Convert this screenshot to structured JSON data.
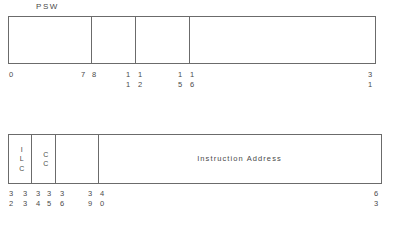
{
  "diagram": {
    "title": "PSW",
    "registers": [
      {
        "id": "psw",
        "caption": "PSW",
        "bit_range": [
          0,
          31
        ],
        "fields": [
          {
            "label": "",
            "start_bit": 0,
            "end_bit": 7
          },
          {
            "label": "",
            "start_bit": 8,
            "end_bit": 11
          },
          {
            "label": "",
            "start_bit": 12,
            "end_bit": 15
          },
          {
            "label": "",
            "start_bit": 16,
            "end_bit": 31
          }
        ],
        "bit_markers": [
          {
            "value": "0",
            "tens": "0",
            "ones": ""
          },
          {
            "value": "7",
            "tens": "7",
            "ones": ""
          },
          {
            "value": "8",
            "tens": "8",
            "ones": ""
          },
          {
            "value": "11",
            "tens": "1",
            "ones": "1"
          },
          {
            "value": "12",
            "tens": "1",
            "ones": "2"
          },
          {
            "value": "15",
            "tens": "1",
            "ones": "5"
          },
          {
            "value": "16",
            "tens": "1",
            "ones": "6"
          },
          {
            "value": "31",
            "tens": "3",
            "ones": "1"
          }
        ]
      },
      {
        "id": "psw2",
        "caption": "",
        "bit_range": [
          32,
          63
        ],
        "fields": [
          {
            "label": "ILC",
            "label_chars": [
              "I",
              "L",
              "C"
            ],
            "start_bit": 32,
            "end_bit": 33
          },
          {
            "label": "CC",
            "label_chars": [
              "C",
              "C"
            ],
            "start_bit": 34,
            "end_bit": 35
          },
          {
            "label": "",
            "label_chars": [],
            "start_bit": 36,
            "end_bit": 39
          },
          {
            "label": "Instruction Address",
            "label_chars": [],
            "start_bit": 40,
            "end_bit": 63
          }
        ],
        "bit_markers": [
          {
            "value": "32",
            "tens": "3",
            "ones": "2"
          },
          {
            "value": "33",
            "tens": "3",
            "ones": "3"
          },
          {
            "value": "34",
            "tens": "3",
            "ones": "4"
          },
          {
            "value": "35",
            "tens": "3",
            "ones": "5"
          },
          {
            "value": "36",
            "tens": "3",
            "ones": "6"
          },
          {
            "value": "39",
            "tens": "3",
            "ones": "9"
          },
          {
            "value": "40",
            "tens": "4",
            "ones": "0"
          },
          {
            "value": "63",
            "tens": "6",
            "ones": "3"
          }
        ]
      }
    ],
    "labels": {
      "ilc_line1": "I",
      "ilc_line2": "L",
      "ilc_line3": "C",
      "cc_line1": "C",
      "cc_line2": "C",
      "instruction_address": "Instruction Address"
    },
    "colors": {
      "line": "#6b6b6b",
      "text": "#4a4a4a",
      "background": "#ffffff"
    }
  }
}
